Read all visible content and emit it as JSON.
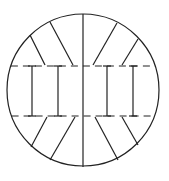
{
  "diagram": {
    "type": "circle-sectioned-line-drawing",
    "canvas": {
      "width": 169,
      "height": 181
    },
    "stroke_color": "#222222",
    "background": "#ffffff",
    "circle": {
      "cx": 83,
      "cy": 90,
      "r": 76
    },
    "center_line": {
      "x1": 83,
      "y1": 14,
      "x2": 83,
      "y2": 167
    },
    "dashed_lines": [
      {
        "name": "upper-dashed-line",
        "y": 66,
        "x1": 10,
        "x2": 156,
        "dash": "7,5"
      },
      {
        "name": "lower-dashed-line",
        "y": 116,
        "x1": 10,
        "x2": 156,
        "dash": "7,5"
      }
    ],
    "i_beams": [
      {
        "x": 32,
        "y1": 66,
        "y2": 116,
        "cap": 4
      },
      {
        "x": 58,
        "y1": 66,
        "y2": 116,
        "cap": 4
      },
      {
        "x": 107,
        "y1": 66,
        "y2": 116,
        "cap": 4
      },
      {
        "x": 133,
        "y1": 66,
        "y2": 116,
        "cap": 4
      }
    ],
    "diagonals": [
      {
        "name": "top-left-outer",
        "x1": 30,
        "y1": 35,
        "x2": 45,
        "y2": 65
      },
      {
        "name": "top-left-inner",
        "x1": 50,
        "y1": 22,
        "x2": 73,
        "y2": 65
      },
      {
        "name": "top-right-inner",
        "x1": 117,
        "y1": 23,
        "x2": 93,
        "y2": 65
      },
      {
        "name": "top-right-outer",
        "x1": 138,
        "y1": 39,
        "x2": 122,
        "y2": 65
      },
      {
        "name": "bottom-left-outer",
        "x1": 47,
        "y1": 117,
        "x2": 31,
        "y2": 147
      },
      {
        "name": "bottom-left-inner",
        "x1": 75,
        "y1": 117,
        "x2": 50,
        "y2": 160
      },
      {
        "name": "bottom-right-inner",
        "x1": 95,
        "y1": 117,
        "x2": 118,
        "y2": 160
      },
      {
        "name": "bottom-right-outer",
        "x1": 122,
        "y1": 117,
        "x2": 138,
        "y2": 145
      }
    ]
  }
}
